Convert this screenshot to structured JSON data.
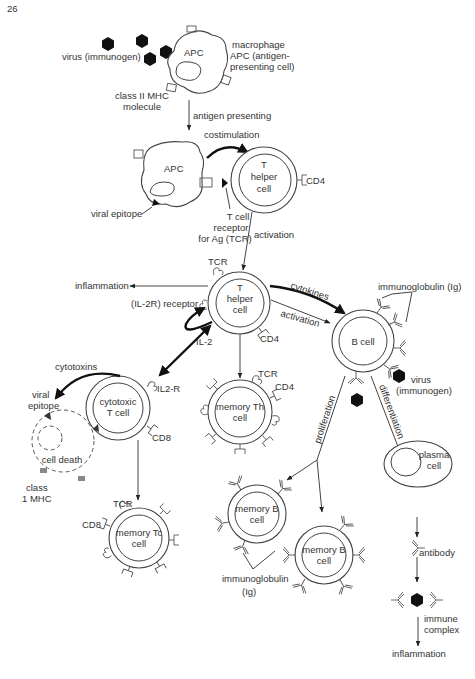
{
  "page_number": "26",
  "labels": {
    "virus_top": "virus (immunogen)",
    "apc_top": "APC",
    "macrophage": [
      "macrophage",
      "APC (antigen-",
      "presenting cell)"
    ],
    "class2_mhc": [
      "class II MHC",
      "molecule"
    ],
    "antigen_presenting": "antigen presenting",
    "costimulation": "costimulation",
    "apc_mid": "APC",
    "th_top": [
      "T",
      "helper",
      "cell"
    ],
    "cd4_top": "CD4",
    "viral_epitope_mid": "viral epitope",
    "tcr_label": [
      "T cell",
      "receptor",
      "for Ag (TCR)"
    ],
    "activation_top": "activation",
    "tcr_center": "TCR",
    "inflammation_left": "inflammation",
    "il2r_receptor": "(IL-2R) receptor",
    "th_center": [
      "T",
      "helper",
      "cell"
    ],
    "cytokines": "cytokines",
    "activation_mid": "activation",
    "cd4_center": "CD4",
    "il2": "IL-2",
    "bcell": "B cell",
    "immunoglobulin_top": "immunoglobulin (Ig)",
    "virus_right": [
      "virus",
      "(immunogen)"
    ],
    "cytotoxins": "cytotoxins",
    "viral_epitope_left": [
      "viral",
      "epitope"
    ],
    "cytotoxic": [
      "cytotoxic",
      "T cell"
    ],
    "il2r": "IL2-R",
    "cd8_a": "CD8",
    "cell_death": "cell death",
    "class1_mhc": [
      "class",
      "1 MHC"
    ],
    "memory_th": [
      "memory Th",
      "cell"
    ],
    "tcr_memth": "TCR",
    "cd4_memth": "CD4",
    "proliferation": "proliferation",
    "differentiation": "differentiation",
    "plasma": [
      "plasma",
      "cell"
    ],
    "tcr_memtc": "TCR",
    "cd8_b": "CD8",
    "memory_tc": [
      "memory Tc",
      "cell"
    ],
    "memory_b1": [
      "memory B",
      "cell"
    ],
    "memory_b2": [
      "memory B",
      "cell"
    ],
    "immunoglobulin_bottom": [
      "immunoglobulin",
      "(Ig)"
    ],
    "antibody": "antibody",
    "immune_complex": [
      "immune",
      "complex"
    ],
    "inflammation_bottom": "inflammation"
  }
}
